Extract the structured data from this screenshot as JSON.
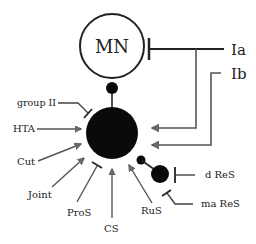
{
  "diagram": {
    "colors": {
      "stroke": "#222222",
      "fill_dark": "#0a0a0a",
      "arrow_fill": "#6a6a6a",
      "background": "#ffffff"
    },
    "nodes": {
      "motoneuron": {
        "label": "MN"
      },
      "interneuron": {
        "label": ""
      },
      "renshaw_small": {
        "label": ""
      }
    },
    "inputs": {
      "ia": {
        "label": "Ia",
        "type": "inhibitory-bar"
      },
      "ib": {
        "label": "Ib",
        "type": "excitatory-arrow"
      },
      "group2": {
        "label": "group II",
        "type": "inhibitory-bar"
      },
      "hta": {
        "label": "HTA",
        "type": "excitatory-arrow"
      },
      "cut": {
        "label": "Cut",
        "type": "excitatory-arrow"
      },
      "joint": {
        "label": "Joint",
        "type": "excitatory-arrow"
      },
      "pros": {
        "label": "ProS",
        "type": "inhibitory-bar"
      },
      "cs": {
        "label": "CS",
        "type": "excitatory-arrow"
      },
      "rus": {
        "label": "RuS",
        "type": "excitatory-arrow"
      },
      "dres": {
        "label": "d ReS",
        "type": "inhibitory-bar"
      },
      "mares": {
        "label": "ma ReS",
        "type": "inhibitory-bar"
      }
    }
  }
}
